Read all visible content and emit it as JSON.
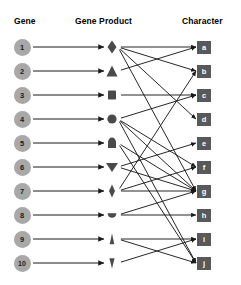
{
  "headers": {
    "gene": "Gene",
    "product": "Gene Product",
    "character": "Character"
  },
  "colors": {
    "gene_circle": "#a8a8a8",
    "character_box": "#595959",
    "character_text": "#ffffff",
    "shape": "#4a4a4a",
    "arrow": "#1a1a1a",
    "background": "#ffffff",
    "header_text": "#000000"
  },
  "genes": [
    {
      "label": "1",
      "y": 47
    },
    {
      "label": "2",
      "y": 71
    },
    {
      "label": "3",
      "y": 95
    },
    {
      "label": "4",
      "y": 119
    },
    {
      "label": "5",
      "y": 143
    },
    {
      "label": "6",
      "y": 167
    },
    {
      "label": "7",
      "y": 191
    },
    {
      "label": "8",
      "y": 215
    },
    {
      "label": "9",
      "y": 239
    },
    {
      "label": "10",
      "y": 263
    }
  ],
  "products": [
    {
      "index": 1,
      "shape": "diamond",
      "y": 47
    },
    {
      "index": 2,
      "shape": "triangle-up",
      "y": 71
    },
    {
      "index": 3,
      "shape": "square",
      "y": 95
    },
    {
      "index": 4,
      "shape": "circle",
      "y": 119
    },
    {
      "index": 5,
      "shape": "dome",
      "y": 143
    },
    {
      "index": 6,
      "shape": "triangle-down",
      "y": 167
    },
    {
      "index": 7,
      "shape": "diamond-narrow",
      "y": 191
    },
    {
      "index": 8,
      "shape": "semicircle-down",
      "y": 215
    },
    {
      "index": 9,
      "shape": "spike-up",
      "y": 239
    },
    {
      "index": 10,
      "shape": "spike-down",
      "y": 263
    }
  ],
  "characters": [
    {
      "label": "a",
      "y": 47
    },
    {
      "label": "b",
      "y": 71
    },
    {
      "label": "c",
      "y": 95
    },
    {
      "label": "d",
      "y": 119
    },
    {
      "label": "e",
      "y": 143
    },
    {
      "label": "f",
      "y": 167
    },
    {
      "label": "g",
      "y": 191
    },
    {
      "label": "h",
      "y": 215
    },
    {
      "label": "i",
      "y": 239
    },
    {
      "label": "j",
      "y": 263
    }
  ],
  "gene_to_product_edges": [
    {
      "gene": 1,
      "product": 1
    },
    {
      "gene": 2,
      "product": 2
    },
    {
      "gene": 3,
      "product": 3
    },
    {
      "gene": 4,
      "product": 4
    },
    {
      "gene": 5,
      "product": 5
    },
    {
      "gene": 6,
      "product": 6
    },
    {
      "gene": 7,
      "product": 7
    },
    {
      "gene": 8,
      "product": 8
    },
    {
      "gene": 9,
      "product": 9
    },
    {
      "gene": 10,
      "product": 10
    }
  ],
  "product_to_character_edges": [
    {
      "product": 1,
      "character": "a"
    },
    {
      "product": 1,
      "character": "b"
    },
    {
      "product": 1,
      "character": "d"
    },
    {
      "product": 1,
      "character": "g"
    },
    {
      "product": 2,
      "character": "a"
    },
    {
      "product": 3,
      "character": "c"
    },
    {
      "product": 4,
      "character": "c"
    },
    {
      "product": 4,
      "character": "f"
    },
    {
      "product": 4,
      "character": "g"
    },
    {
      "product": 4,
      "character": "j"
    },
    {
      "product": 5,
      "character": "g"
    },
    {
      "product": 5,
      "character": "j"
    },
    {
      "product": 6,
      "character": "e"
    },
    {
      "product": 6,
      "character": "g"
    },
    {
      "product": 7,
      "character": "b"
    },
    {
      "product": 7,
      "character": "f"
    },
    {
      "product": 7,
      "character": "g"
    },
    {
      "product": 8,
      "character": "g"
    },
    {
      "product": 8,
      "character": "h"
    },
    {
      "product": 9,
      "character": "i"
    },
    {
      "product": 9,
      "character": "j"
    },
    {
      "product": 10,
      "character": "i"
    }
  ],
  "geometry": {
    "gene_x": 22,
    "product_x": 112,
    "character_x": 204,
    "gene_arrow_start": 33,
    "gene_arrow_end": 104,
    "product_edge_start": 120,
    "character_edge_end": 196
  }
}
